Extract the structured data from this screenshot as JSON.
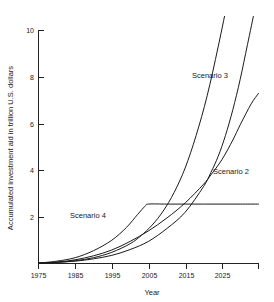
{
  "chart_data": {
    "type": "line",
    "title": "",
    "xlabel": "Year",
    "ylabel": "Accumulated investment aid in trillion U.S. dollars",
    "xlim": [
      1975,
      2035
    ],
    "ylim": [
      0,
      11
    ],
    "grid": false,
    "legend": "inline-labels",
    "x_ticks": [
      1975,
      1985,
      1995,
      2005,
      2015,
      2025,
      2035
    ],
    "x_tick_labels": [
      "1975",
      "1985",
      "1995",
      "2005",
      "2015",
      "2025",
      ""
    ],
    "y_ticks": [
      2,
      4,
      6,
      8,
      10
    ],
    "y_tick_labels": [
      "2",
      "4",
      "6",
      "8",
      "10"
    ],
    "series": [
      {
        "name": "Scenario 1",
        "label_shown": "",
        "x": [
          1975,
          1980,
          1985,
          1990,
          1995,
          1999,
          2002,
          2004,
          2005,
          2010,
          2015,
          2020,
          2025,
          2030,
          2035
        ],
        "values": [
          0.02,
          0.1,
          0.25,
          0.55,
          1.0,
          1.55,
          2.1,
          2.45,
          2.55,
          2.55,
          2.55,
          2.55,
          2.55,
          2.55,
          2.55
        ]
      },
      {
        "name": "Scenario 4",
        "label_shown": "Scenario 4",
        "x": [
          1975,
          1980,
          1985,
          1990,
          1995,
          2000,
          2005,
          2010,
          2015,
          2020,
          2022,
          2025,
          2028,
          2030,
          2033,
          2035
        ],
        "values": [
          0.02,
          0.06,
          0.16,
          0.33,
          0.58,
          0.95,
          1.4,
          1.95,
          2.6,
          3.4,
          3.8,
          4.45,
          5.3,
          5.95,
          6.85,
          7.3
        ]
      },
      {
        "name": "Scenario 2",
        "label_shown": "Scenario 2",
        "x": [
          1975,
          1980,
          1985,
          1990,
          1995,
          2000,
          2005,
          2010,
          2015,
          2020,
          2022,
          2024,
          2026,
          2028,
          2030,
          2032,
          2034,
          2035
        ],
        "values": [
          0.02,
          0.05,
          0.1,
          0.2,
          0.35,
          0.6,
          0.95,
          1.5,
          2.2,
          3.3,
          3.9,
          4.6,
          5.5,
          6.6,
          7.9,
          9.4,
          10.9,
          11.6
        ]
      },
      {
        "name": "Scenario 3",
        "label_shown": "Scenario 3",
        "x": [
          1975,
          1980,
          1985,
          1990,
          1995,
          2000,
          2003,
          2006,
          2009,
          2012,
          2015,
          2018,
          2021,
          2024,
          2027,
          2030
        ],
        "values": [
          0.02,
          0.05,
          0.12,
          0.25,
          0.48,
          0.85,
          1.2,
          1.65,
          2.25,
          3.05,
          4.1,
          5.5,
          7.2,
          9.3,
          11.6,
          14.0
        ]
      }
    ],
    "series_label_positions": [
      {
        "name": "Scenario 4",
        "x_px": 70,
        "y_px": 218
      },
      {
        "name": "Scenario 3",
        "x_px": 192,
        "y_px": 78
      },
      {
        "name": "Scenario 2",
        "x_px": 213,
        "y_px": 174
      }
    ]
  }
}
